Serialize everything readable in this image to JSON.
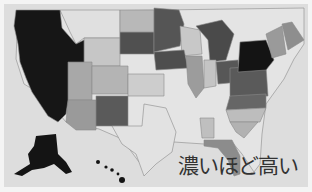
{
  "map": {
    "title": "US states choropleth",
    "legend_text": "濃いほど高い",
    "colors": {
      "background": "#dddddd",
      "darkest": "#161616",
      "dark": "#4a4a4a",
      "mid_dark": "#6e6e6e",
      "mid": "#9a9a9a",
      "light_mid": "#b8b8b8",
      "light": "#cfcfcf",
      "lightest": "#e6e6e6"
    },
    "regions": [
      {
        "name": "west-coast",
        "shade": "darkest"
      },
      {
        "name": "new-york",
        "shade": "darkest"
      },
      {
        "name": "alaska",
        "shade": "darkest"
      },
      {
        "name": "hawaii",
        "shade": "darkest"
      },
      {
        "name": "dakotas-minnesota",
        "shade": "dark"
      },
      {
        "name": "michigan",
        "shade": "dark"
      },
      {
        "name": "new-mexico",
        "shade": "dark"
      },
      {
        "name": "mid-atlantic",
        "shade": "dark"
      },
      {
        "name": "arizona",
        "shade": "mid"
      },
      {
        "name": "florida",
        "shade": "mid"
      },
      {
        "name": "illinois",
        "shade": "mid"
      },
      {
        "name": "maine",
        "shade": "mid"
      }
    ]
  }
}
